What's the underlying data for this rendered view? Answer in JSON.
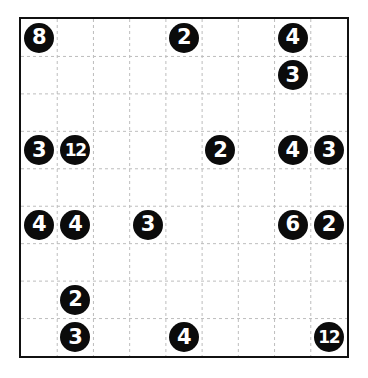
{
  "puzzle": {
    "name": "number-circle-grid-puzzle",
    "rows": 9,
    "cols": 9,
    "background_color": "#ffffff",
    "border_color": "#111111",
    "gridline_color": "#bdbdbd",
    "gridline_style": "dashed",
    "token_fill_color": "#0b0b0b",
    "token_text_color": "#ffffff",
    "clues": [
      {
        "row": 0,
        "col": 0,
        "value": "8"
      },
      {
        "row": 0,
        "col": 4,
        "value": "2"
      },
      {
        "row": 0,
        "col": 7,
        "value": "4"
      },
      {
        "row": 1,
        "col": 7,
        "value": "3"
      },
      {
        "row": 3,
        "col": 0,
        "value": "3"
      },
      {
        "row": 3,
        "col": 1,
        "value": "12"
      },
      {
        "row": 3,
        "col": 5,
        "value": "2"
      },
      {
        "row": 3,
        "col": 7,
        "value": "4"
      },
      {
        "row": 3,
        "col": 8,
        "value": "3"
      },
      {
        "row": 5,
        "col": 0,
        "value": "4"
      },
      {
        "row": 5,
        "col": 1,
        "value": "4"
      },
      {
        "row": 5,
        "col": 3,
        "value": "3"
      },
      {
        "row": 5,
        "col": 7,
        "value": "6"
      },
      {
        "row": 5,
        "col": 8,
        "value": "2"
      },
      {
        "row": 7,
        "col": 1,
        "value": "2"
      },
      {
        "row": 8,
        "col": 1,
        "value": "3"
      },
      {
        "row": 8,
        "col": 4,
        "value": "4"
      },
      {
        "row": 8,
        "col": 8,
        "value": "12"
      }
    ]
  }
}
